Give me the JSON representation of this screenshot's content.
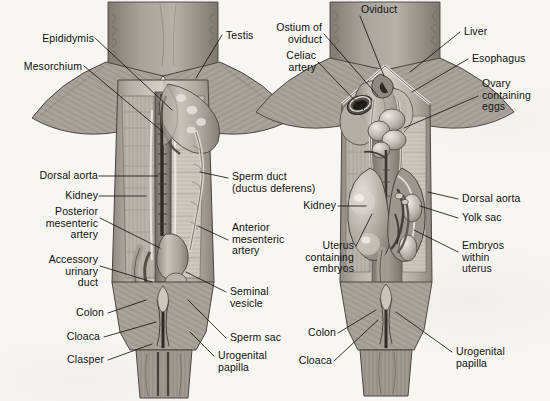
{
  "figure": {
    "background_color": "#f7f6f3",
    "ink_color": "#100f0d",
    "style": "grayscale halftone anatomical illustration"
  },
  "panels": [
    {
      "id": "left",
      "name": "male-dissection",
      "sex": "male"
    },
    {
      "id": "right",
      "name": "female-dissection",
      "sex": "female"
    }
  ],
  "labels": {
    "left_panel": {
      "epididymis": "Epididymis",
      "mesorchium": "Mesorchium",
      "testis": "Testis",
      "dorsal_aorta": "Dorsal aorta",
      "kidney": "Kidney",
      "posterior_mesenteric_artery": "Posterior\nmesenteric\nartery",
      "accessory_urinary_duct": "Accessory\nurinary\nduct",
      "colon": "Colon",
      "cloaca": "Cloaca",
      "clasper": "Clasper",
      "sperm_duct": "Sperm duct\n(ductus deferens)",
      "anterior_mesenteric_artery": "Anterior\nmesenteric\nartery",
      "seminal_vesicle": "Seminal\nvesicle",
      "sperm_sac": "Sperm sac",
      "urogenital_papilla": "Urogenital\npapilla"
    },
    "right_panel": {
      "oviduct": "Oviduct",
      "ostium_of_oviduct": "Ostium of\noviduct",
      "celiac_artery": "Celiac\nartery",
      "liver": "Liver",
      "esophagus": "Esophagus",
      "ovary_containing_eggs": "Ovary\ncontaining\neggs",
      "kidney": "Kidney",
      "uterus_containing_embryos": "Uterus\ncontaining\nembryos",
      "dorsal_aorta": "Dorsal aorta",
      "yolk_sac": "Yolk sac",
      "embryos_within_uterus": "Embryos\nwithin\nuterus",
      "colon": "Colon",
      "cloaca": "Cloaca",
      "urogenital_papilla": "Urogenital\npapilla"
    }
  }
}
